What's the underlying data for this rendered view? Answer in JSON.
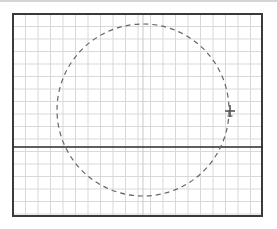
{
  "diagram": {
    "type": "grid-plot",
    "frame": {
      "x": 13,
      "y": 14,
      "width": 249,
      "height": 202,
      "stroke": "#3a3a3a"
    },
    "grid": {
      "spacing": 12.5,
      "color": "#d9d9d9",
      "major_color": "#c8c8c8"
    },
    "divider": {
      "y": 147,
      "stroke": "#2a2a2a"
    },
    "circle": {
      "cx": 143,
      "cy": 110,
      "r": 86,
      "stroke": "#666666",
      "dash": "5,4"
    },
    "marker": {
      "icon": "aircraft-crosshair-icon",
      "x": 230,
      "y": 111,
      "color": "#555555"
    }
  }
}
